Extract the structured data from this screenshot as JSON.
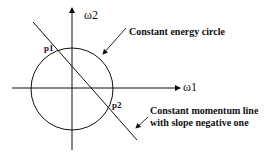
{
  "diagram": {
    "axes": {
      "x_label": "ω1",
      "y_label": "ω2"
    },
    "points": {
      "p1": "p1",
      "p2": "p2"
    },
    "annotations": {
      "circle": "Constant energy circle",
      "line_1": "Constant momentum line",
      "line_2": "with slope negative one"
    },
    "colors": {
      "stroke": "#111111",
      "background": "#ffffff"
    }
  }
}
